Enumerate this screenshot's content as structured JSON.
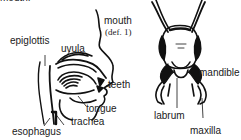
{
  "figure": {
    "top_partial_text": "mouth:",
    "human_mouth": {
      "labels": {
        "mouth": "mouth",
        "mouth_def": "(def. 1)",
        "epiglottis": "epiglottis",
        "uvula": "uvula",
        "teeth": "teeth",
        "tongue": "tongue",
        "trachea": "trachea",
        "esophagus": "esophagus"
      }
    },
    "insect_head": {
      "labels": {
        "mandible": "mandible",
        "labrum": "labrum",
        "maxilla": "maxilla"
      }
    },
    "colors": {
      "ink": "#111111",
      "background": "#ffffff"
    }
  }
}
